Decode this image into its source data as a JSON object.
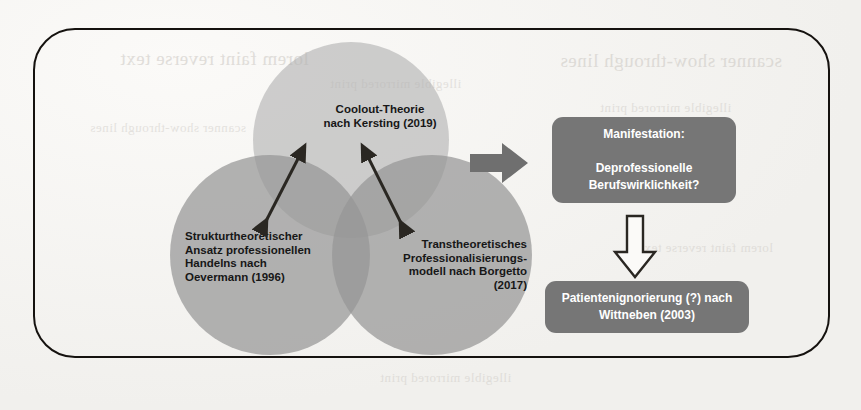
{
  "diagram": {
    "type": "venn-flow",
    "frame": {
      "shape": "rounded-rectangle"
    },
    "circles": [
      {
        "id": "coolout",
        "position": "top",
        "label": "Coolout-Theorie\nnach Kersting (2019)",
        "fill": "#b2b2b2"
      },
      {
        "id": "strukturtheoretisch",
        "position": "bottom-left",
        "label": "Strukturtheoretischer\nAnsatz professionellen\nHandelns nach\nOevermann (1996)",
        "fill": "#969696"
      },
      {
        "id": "transtheoretisch",
        "position": "bottom-right",
        "label": "Transtheoretisches\nProfessionalisierungs-\nmodell nach Borgetto\n(2017)",
        "fill": "#969696"
      }
    ],
    "connectors": [
      {
        "id": "arrow-left-top",
        "style": "double-headed",
        "from": "strukturtheoretisch",
        "to": "coolout"
      },
      {
        "id": "arrow-right-top",
        "style": "double-headed",
        "from": "transtheoretisch",
        "to": "coolout"
      },
      {
        "id": "arrow-venn-to-manifestation",
        "style": "solid-block-arrow",
        "direction": "right"
      },
      {
        "id": "arrow-manifestation-to-patient",
        "style": "hollow-block-arrow",
        "direction": "down"
      }
    ],
    "boxes": [
      {
        "id": "manifestation",
        "label": "Manifestation:\n\nDeprofessionelle\nBerufswirklichkeit?",
        "fill": "#767676",
        "text_color": "#ffffff"
      },
      {
        "id": "patientenignorierung",
        "label": "Patientenignorierung (?) nach\nWittneben (2003)",
        "fill": "#767676",
        "text_color": "#ffffff"
      }
    ],
    "background": {
      "kind": "scanned-page",
      "bleed_through": [
        "lorem faint reverse text",
        "illegible mirrored print",
        "scanner show-through lines"
      ]
    }
  }
}
